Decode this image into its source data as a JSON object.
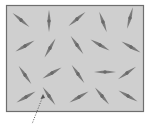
{
  "diagram": {
    "type": "dipole-orientation",
    "colors": {
      "background": "#ffffff",
      "box_fill": "#cfcfcf",
      "box_stroke": "#6e6e6e",
      "needle": "#7a7a7a",
      "needle_center": "#6a6a6a",
      "leader": "#555555"
    },
    "box": {
      "x": 6.5,
      "y": 5.5,
      "width": 137,
      "height": 106
    },
    "needles": [
      {
        "x": 21,
        "y": 20,
        "angle": 40
      },
      {
        "x": 49,
        "y": 21,
        "angle": 90
      },
      {
        "x": 77,
        "y": 19,
        "angle": -40
      },
      {
        "x": 103,
        "y": 22,
        "angle": 70
      },
      {
        "x": 130,
        "y": 18,
        "angle": -75
      },
      {
        "x": 25,
        "y": 46,
        "angle": -30
      },
      {
        "x": 50,
        "y": 48,
        "angle": -60
      },
      {
        "x": 77,
        "y": 45,
        "angle": 55
      },
      {
        "x": 100,
        "y": 45,
        "angle": 30
      },
      {
        "x": 131,
        "y": 47,
        "angle": 30
      },
      {
        "x": 25,
        "y": 75,
        "angle": 55
      },
      {
        "x": 52,
        "y": 73,
        "angle": -30
      },
      {
        "x": 78,
        "y": 74,
        "angle": 55
      },
      {
        "x": 105,
        "y": 72,
        "angle": 0
      },
      {
        "x": 127,
        "y": 73,
        "angle": -35
      },
      {
        "x": 26,
        "y": 97,
        "angle": -30
      },
      {
        "x": 49,
        "y": 96,
        "angle": 55
      },
      {
        "x": 79,
        "y": 97,
        "angle": -30
      },
      {
        "x": 102,
        "y": 96,
        "angle": 50
      },
      {
        "x": 128,
        "y": 96,
        "angle": 30
      }
    ],
    "leader_line": {
      "x1": 43,
      "y1": 96,
      "x2": 32,
      "y2": 124,
      "style": "dotted"
    }
  }
}
